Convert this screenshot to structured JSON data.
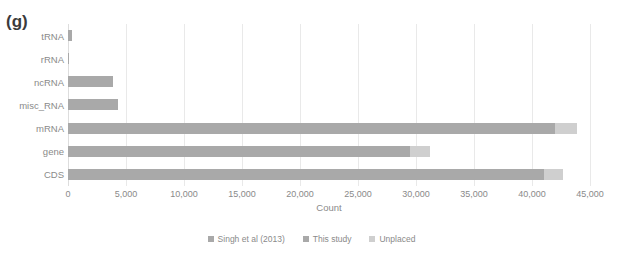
{
  "panel": {
    "label": "(g)"
  },
  "chart_data": {
    "type": "bar",
    "orientation": "horizontal",
    "stacked": true,
    "title": "",
    "subtitle": "",
    "xlabel": "Count",
    "ylabel": "",
    "xlim": [
      0,
      45000
    ],
    "grid": false,
    "legend_position": "bottom",
    "categories": [
      "tRNA",
      "rRNA",
      "ncRNA",
      "misc_RNA",
      "mRNA",
      "gene",
      "CDS"
    ],
    "tick_labels": [
      "0",
      "5,000",
      "10,000",
      "15,000",
      "20,000",
      "25,000",
      "30,000",
      "35,000",
      "40,000",
      "45,000"
    ],
    "tick_values": [
      0,
      5000,
      10000,
      15000,
      20000,
      25000,
      30000,
      35000,
      40000,
      45000
    ],
    "series": [
      {
        "name": "Singh et al (2013)",
        "color": "#a9a9a9",
        "values": [
          350,
          50,
          3900,
          4300,
          0,
          0,
          0
        ]
      },
      {
        "name": "This study",
        "color": "#a9a9a9",
        "values": [
          0,
          0,
          0,
          0,
          42000,
          29500,
          41000
        ]
      },
      {
        "name": "Unplaced",
        "color": "#cfcfcf",
        "values": [
          0,
          0,
          0,
          0,
          1900,
          1700,
          1700
        ]
      }
    ],
    "bars": [
      {
        "category": "tRNA",
        "main": 350,
        "unplaced": 0
      },
      {
        "category": "rRNA",
        "main": 50,
        "unplaced": 0
      },
      {
        "category": "ncRNA",
        "main": 3900,
        "unplaced": 0
      },
      {
        "category": "misc_RNA",
        "main": 4300,
        "unplaced": 0
      },
      {
        "category": "mRNA",
        "main": 42000,
        "unplaced": 1900
      },
      {
        "category": "gene",
        "main": 29500,
        "unplaced": 1700
      },
      {
        "category": "CDS",
        "main": 41000,
        "unplaced": 1700
      }
    ]
  },
  "legend": {
    "items": [
      {
        "label": "Singh et al (2013)",
        "color": "#a9a9a9"
      },
      {
        "label": "This study",
        "color": "#a9a9a9"
      },
      {
        "label": "Unplaced",
        "color": "#cfcfcf"
      }
    ]
  }
}
